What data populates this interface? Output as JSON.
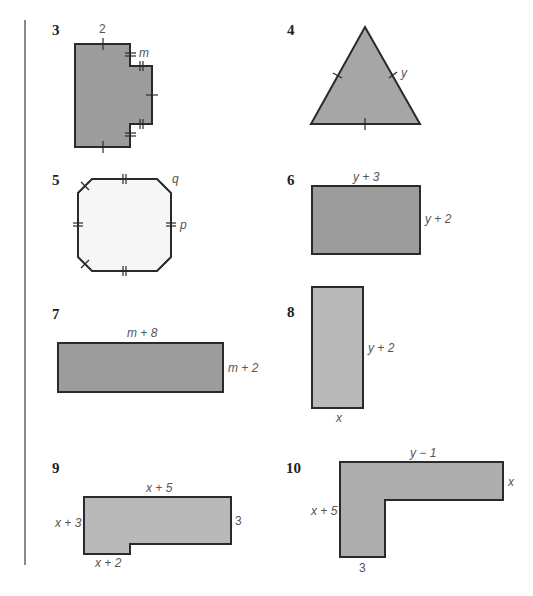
{
  "exercises": [
    {
      "number": "3",
      "shape": "notched-rectangle",
      "labels": {
        "top": "2",
        "notch": "m"
      }
    },
    {
      "number": "4",
      "shape": "equilateral-triangle",
      "labels": {
        "side": "y"
      }
    },
    {
      "number": "5",
      "shape": "octagon",
      "labels": {
        "corner": "q",
        "side": "p"
      }
    },
    {
      "number": "6",
      "shape": "rectangle",
      "labels": {
        "top": "y + 3",
        "right": "y + 2"
      }
    },
    {
      "number": "7",
      "shape": "rectangle",
      "labels": {
        "top": "m + 8",
        "right": "m + 2"
      }
    },
    {
      "number": "8",
      "shape": "rectangle",
      "labels": {
        "right": "y + 2",
        "bottom": "x"
      }
    },
    {
      "number": "9",
      "shape": "L-shape",
      "labels": {
        "top": "x + 5",
        "left": "x + 3",
        "right": "3",
        "bottom": "x + 2"
      }
    },
    {
      "number": "10",
      "shape": "L-shape",
      "labels": {
        "top": "y − 1",
        "right": "x",
        "left": "x + 5",
        "bottom": "3"
      }
    }
  ],
  "colors": {
    "fill_dark": "#9c9c9c",
    "fill_light": "#b9b9b9",
    "fill_octagon": "#f6f6f6",
    "stroke": "#2a2a2a"
  }
}
